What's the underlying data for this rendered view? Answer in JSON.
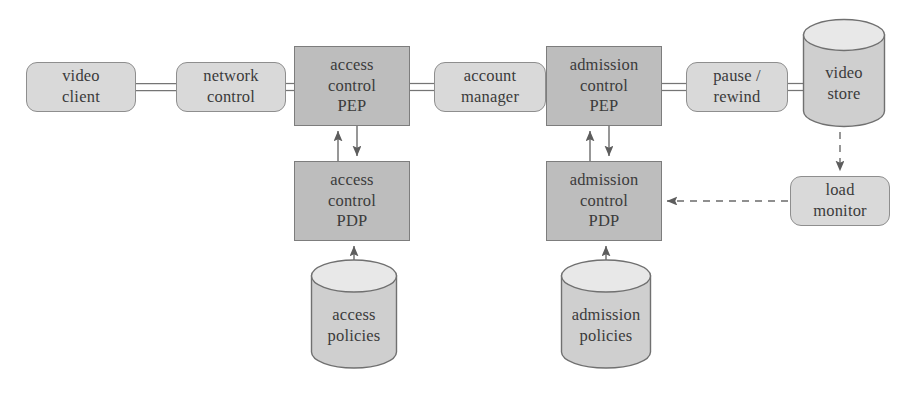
{
  "diagram": {
    "colors": {
      "canvas": "#ffffff",
      "rounded_fill": "#d9d9d9",
      "rounded_stroke": "#8e8e8e",
      "rect_fill": "#bdbdbd",
      "rect_stroke": "#7d7d7d",
      "cylinder_body_fill": "#cfcfcf",
      "cylinder_top_fill": "#e6e6e6",
      "cylinder_stroke": "#707070",
      "edge_stroke": "#6e6e6e",
      "text": "#3b3b3b"
    },
    "nodes": [
      {
        "id": "video-client",
        "shape": "rounded",
        "lines": [
          "video",
          "client"
        ],
        "x": 26,
        "y": 62,
        "w": 110,
        "h": 50
      },
      {
        "id": "network-control",
        "shape": "rounded",
        "lines": [
          "network",
          "control"
        ],
        "x": 176,
        "y": 62,
        "w": 110,
        "h": 50
      },
      {
        "id": "access-control-pep",
        "shape": "rect",
        "lines": [
          "access",
          "control",
          "PEP"
        ],
        "x": 294,
        "y": 46,
        "w": 116,
        "h": 80
      },
      {
        "id": "account-manager",
        "shape": "rounded",
        "lines": [
          "account",
          "manager"
        ],
        "x": 434,
        "y": 62,
        "w": 112,
        "h": 50
      },
      {
        "id": "admission-control-pep",
        "shape": "rect",
        "lines": [
          "admission",
          "control",
          "PEP"
        ],
        "x": 546,
        "y": 46,
        "w": 116,
        "h": 80
      },
      {
        "id": "pause-rewind",
        "shape": "rounded",
        "lines": [
          "pause /",
          "rewind"
        ],
        "x": 686,
        "y": 62,
        "w": 102,
        "h": 50
      },
      {
        "id": "video-store",
        "shape": "cylinder",
        "lines": [
          "video",
          "store"
        ],
        "x": 802,
        "y": 18,
        "w": 84,
        "h": 110
      },
      {
        "id": "access-control-pdp",
        "shape": "rect",
        "lines": [
          "access",
          "control",
          "PDP"
        ],
        "x": 294,
        "y": 161,
        "w": 116,
        "h": 80
      },
      {
        "id": "admission-control-pdp",
        "shape": "rect",
        "lines": [
          "admission",
          "control",
          "PDP"
        ],
        "x": 546,
        "y": 161,
        "w": 116,
        "h": 80
      },
      {
        "id": "load-monitor",
        "shape": "rounded",
        "lines": [
          "load",
          "monitor"
        ],
        "x": 790,
        "y": 176,
        "w": 100,
        "h": 50
      },
      {
        "id": "access-policies",
        "shape": "cylinder",
        "lines": [
          "access",
          "policies"
        ],
        "x": 310,
        "y": 258,
        "w": 88,
        "h": 112
      },
      {
        "id": "admission-policies",
        "shape": "cylinder",
        "lines": [
          "admission",
          "policies"
        ],
        "x": 560,
        "y": 258,
        "w": 92,
        "h": 112
      }
    ],
    "edges": [
      {
        "id": "video-client--network-control",
        "style": "double-line",
        "from": "video-client",
        "to": "network-control"
      },
      {
        "id": "network-control--access-control-pep",
        "style": "double-line",
        "from": "network-control",
        "to": "access-control-pep"
      },
      {
        "id": "access-control-pep--account-manager",
        "style": "double-line",
        "from": "access-control-pep",
        "to": "account-manager"
      },
      {
        "id": "account-manager--admission-control-pep",
        "style": "double-line",
        "from": "account-manager",
        "to": "admission-control-pep"
      },
      {
        "id": "admission-control-pep--pause-rewind",
        "style": "double-line",
        "from": "admission-control-pep",
        "to": "pause-rewind"
      },
      {
        "id": "pause-rewind--video-store",
        "style": "double-line",
        "from": "pause-rewind",
        "to": "video-store"
      },
      {
        "id": "access-control-pdp--access-control-pep",
        "style": "arrow",
        "from": "access-control-pdp",
        "to": "access-control-pep"
      },
      {
        "id": "access-control-pep--access-control-pdp",
        "style": "arrow",
        "from": "access-control-pep",
        "to": "access-control-pdp"
      },
      {
        "id": "admission-control-pdp--admission-control-pep",
        "style": "arrow",
        "from": "admission-control-pdp",
        "to": "admission-control-pep"
      },
      {
        "id": "admission-control-pep--admission-control-pdp",
        "style": "arrow",
        "from": "admission-control-pep",
        "to": "admission-control-pdp"
      },
      {
        "id": "access-policies--access-control-pdp",
        "style": "arrow",
        "from": "access-policies",
        "to": "access-control-pdp"
      },
      {
        "id": "admission-policies--admission-control-pdp",
        "style": "arrow",
        "from": "admission-policies",
        "to": "admission-control-pdp"
      },
      {
        "id": "video-store--load-monitor",
        "style": "dashed-arrow",
        "from": "video-store",
        "to": "load-monitor"
      },
      {
        "id": "load-monitor--admission-control-pdp",
        "style": "dashed-arrow",
        "from": "load-monitor",
        "to": "admission-control-pdp"
      }
    ]
  }
}
